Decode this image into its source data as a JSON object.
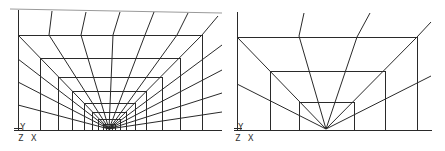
{
  "figure": {
    "type": "finite-element-mesh",
    "panels": [
      {
        "id": "left",
        "description": "Fine graded mesh converging to bottom-center point",
        "axis_labels": {
          "y": "Y",
          "z": "Z",
          "x": "X"
        }
      },
      {
        "id": "right",
        "description": "Coarse graded mesh converging to bottom-center point",
        "axis_labels": {
          "y": "Y",
          "z": "Z",
          "x": "X"
        }
      }
    ],
    "line_color": "#2a2a2a",
    "background": "#ffffff"
  }
}
